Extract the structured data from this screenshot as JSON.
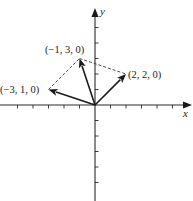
{
  "figure": {
    "type": "vector-diagram",
    "axes": {
      "x_label": "x",
      "y_label": "y",
      "x_ticks": [
        -5,
        -4,
        -3,
        -2,
        -1,
        1,
        2,
        3,
        4,
        5
      ],
      "y_ticks": [
        -5,
        -4,
        -3,
        -2,
        -1,
        1,
        2,
        3,
        4,
        5
      ]
    },
    "vectors": [
      {
        "id": "v1",
        "components": [
          -3,
          1,
          0
        ],
        "label": "(−3, 1, 0)"
      },
      {
        "id": "v2",
        "components": [
          -1,
          3,
          0
        ],
        "label": "(−1, 3, 0)"
      },
      {
        "id": "v3",
        "components": [
          2,
          2,
          0
        ],
        "label": "(2, 2, 0)"
      }
    ],
    "dashed_segments": [
      {
        "from": [
          -3,
          1
        ],
        "to": [
          -1,
          3
        ]
      },
      {
        "from": [
          -1,
          3
        ],
        "to": [
          2,
          2
        ]
      }
    ],
    "colors": {
      "ink": "#1a1a1a",
      "background": "#ffffff"
    }
  }
}
